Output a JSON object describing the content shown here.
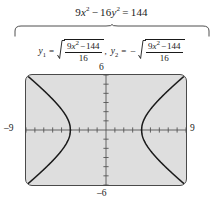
{
  "figure": {
    "kind": "graphing-calculator-figure",
    "main_equation": {
      "lhs_coef_x": "9",
      "x_var": "x",
      "x_exp": "2",
      "op1": "−",
      "lhs_coef_y": "16",
      "y_var": "y",
      "y_exp": "2",
      "equals": "=",
      "rhs": "144",
      "plain": "9x² − 16y² = 144"
    },
    "brace": {
      "style": "over-brace",
      "label": "solve-for-y-brace"
    },
    "derived": [
      {
        "lhs": "y",
        "sub": "1",
        "equals": "=",
        "sign": "",
        "radicand_numerator_coef": "9",
        "radicand_numerator_var": "x",
        "radicand_numerator_exp": "2",
        "radicand_numerator_op": "−",
        "radicand_numerator_const": "144",
        "radicand_denominator": "16",
        "plain": "y₁ = √((9x² − 144)/16)"
      },
      {
        "lhs": "y",
        "sub": "2",
        "equals": "=",
        "sign": "−",
        "radicand_numerator_coef": "9",
        "radicand_numerator_var": "x",
        "radicand_numerator_exp": "2",
        "radicand_numerator_op": "−",
        "radicand_numerator_const": "144",
        "radicand_denominator": "16",
        "plain": "y₂ = −√((9x² − 144)/16)"
      }
    ],
    "separator_comma": ","
  },
  "graph": {
    "xmin_label": "–9",
    "xmax_label": "9",
    "ymax_label": "6",
    "ymin_label": "–6",
    "background_color": "#dedede",
    "frame_color": "#4a4a4a",
    "curve_color": "#1a1a1a",
    "axis_color": "#555555"
  },
  "chart_data": {
    "type": "line",
    "xlabel": "x",
    "ylabel": "y",
    "xlim": [
      -9,
      9
    ],
    "ylim": [
      -6,
      6
    ],
    "xtick_step": 1,
    "ytick_step": 1,
    "grid": false,
    "legend": "none",
    "annotations": [
      "–9",
      "9",
      "6",
      "–6"
    ],
    "series": [
      {
        "name": "y₁ = √((9x²−144)/16)  right branch",
        "x": [
          4,
          4.1,
          4.25,
          4.5,
          4.8,
          5.2,
          5.7,
          6.3,
          7.0,
          7.8,
          8.6,
          9.0
        ],
        "values": [
          0,
          0.507,
          0.8,
          1.148,
          1.551,
          2.015,
          2.537,
          3.123,
          3.763,
          4.455,
          5.178,
          5.543
        ]
      },
      {
        "name": "y₂ = −√((9x²−144)/16)  right branch",
        "x": [
          4,
          4.1,
          4.25,
          4.5,
          4.8,
          5.2,
          5.7,
          6.3,
          7.0,
          7.8,
          8.6,
          9.0
        ],
        "values": [
          0,
          -0.507,
          -0.8,
          -1.148,
          -1.551,
          -2.015,
          -2.537,
          -3.123,
          -3.763,
          -4.455,
          -5.178,
          -5.543
        ]
      },
      {
        "name": "y₁ left branch",
        "x": [
          -4,
          -4.1,
          -4.25,
          -4.5,
          -4.8,
          -5.2,
          -5.7,
          -6.3,
          -7.0,
          -7.8,
          -8.6,
          -9.0
        ],
        "values": [
          0,
          0.507,
          0.8,
          1.148,
          1.551,
          2.015,
          2.537,
          3.123,
          3.763,
          4.455,
          5.178,
          5.543
        ]
      },
      {
        "name": "y₂ left branch",
        "x": [
          -4,
          -4.1,
          -4.25,
          -4.5,
          -4.8,
          -5.2,
          -5.7,
          -6.3,
          -7.0,
          -7.8,
          -8.6,
          -9.0
        ],
        "values": [
          0,
          -0.507,
          -0.8,
          -1.148,
          -1.551,
          -2.015,
          -2.537,
          -3.123,
          -3.763,
          -4.455,
          -5.178,
          -5.543
        ]
      }
    ],
    "vertices": [
      [
        -4,
        0
      ],
      [
        4,
        0
      ]
    ]
  }
}
